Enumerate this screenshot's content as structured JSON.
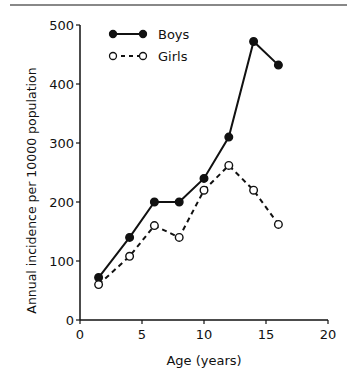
{
  "chart_data": {
    "type": "line",
    "title": "",
    "xlabel": "Age (years)",
    "ylabel": "Annual incidence per 10000 population",
    "xlim": [
      0,
      20
    ],
    "ylim": [
      0,
      500
    ],
    "xticks": [
      0,
      5,
      10,
      15,
      20
    ],
    "yticks": [
      0,
      100,
      200,
      300,
      400,
      500
    ],
    "grid": false,
    "legend_position": "upper left",
    "series": [
      {
        "name": "Boys",
        "style": "solid line, filled circles",
        "x": [
          1.5,
          4,
          6,
          8,
          10,
          12,
          14,
          16
        ],
        "values": [
          72,
          140,
          200,
          200,
          240,
          310,
          472,
          432
        ]
      },
      {
        "name": "Girls",
        "style": "dashed line, open circles",
        "x": [
          1.5,
          4,
          6,
          8,
          10,
          12,
          14,
          16
        ],
        "values": [
          60,
          108,
          160,
          140,
          220,
          262,
          220,
          162
        ]
      }
    ]
  }
}
